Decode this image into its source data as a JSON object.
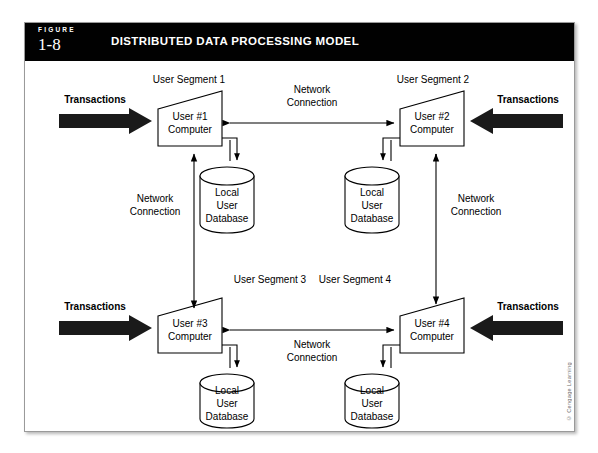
{
  "figure": {
    "label_word": "FIGURE",
    "number": "1-8",
    "title": "DISTRIBUTED DATA PROCESSING MODEL"
  },
  "credit": "© Cengage Learning",
  "diagram": {
    "segments": [
      {
        "id": "seg1",
        "label": "User Segment 1"
      },
      {
        "id": "seg2",
        "label": "User Segment 2"
      },
      {
        "id": "seg3",
        "label": "User Segment 3"
      },
      {
        "id": "seg4",
        "label": "User Segment 4"
      }
    ],
    "computers": [
      {
        "id": "comp1",
        "line1": "User #1",
        "line2": "Computer"
      },
      {
        "id": "comp2",
        "line1": "User #2",
        "line2": "Computer"
      },
      {
        "id": "comp3",
        "line1": "User #3",
        "line2": "Computer"
      },
      {
        "id": "comp4",
        "line1": "User #4",
        "line2": "Computer"
      }
    ],
    "databases": [
      {
        "id": "db1",
        "line1": "Local",
        "line2": "User",
        "line3": "Database"
      },
      {
        "id": "db2",
        "line1": "Local",
        "line2": "User",
        "line3": "Database"
      },
      {
        "id": "db3",
        "line1": "Local",
        "line2": "User",
        "line3": "Database"
      },
      {
        "id": "db4",
        "line1": "Local",
        "line2": "User",
        "line3": "Database"
      }
    ],
    "transactions": [
      {
        "id": "tx1",
        "label": "Transactions"
      },
      {
        "id": "tx2",
        "label": "Transactions"
      },
      {
        "id": "tx3",
        "label": "Transactions"
      },
      {
        "id": "tx4",
        "label": "Transactions"
      }
    ],
    "network_links": [
      {
        "id": "net_top",
        "line1": "Network",
        "line2": "Connection"
      },
      {
        "id": "net_left",
        "line1": "Network",
        "line2": "Connection"
      },
      {
        "id": "net_right",
        "line1": "Network",
        "line2": "Connection"
      },
      {
        "id": "net_bottom",
        "line1": "Network",
        "line2": "Connection"
      }
    ]
  },
  "colors": {
    "header_bg": "#010101",
    "header_fg": "#ffffff",
    "stroke": "#000000",
    "frame_border": "#9a9a9a",
    "arrow_fill": "#1a1a1a"
  }
}
